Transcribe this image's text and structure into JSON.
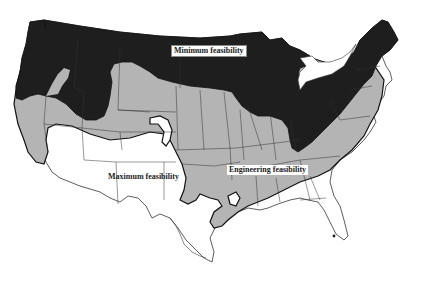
{
  "map": {
    "subject": "Contiguous United States",
    "colors": {
      "minimum_feasibility": "#1e1e1e",
      "engineering_feasibility": "#b4b4b4",
      "maximum_feasibility": "#ffffff",
      "state_border": "#333333",
      "zone_boundary": "#111111"
    },
    "zones": [
      {
        "id": "minimum",
        "label": "Minimum feasibility",
        "fill": "#1e1e1e",
        "region": "Northern tier: Pacific Northwest, northern Rockies & Plains, Great Lakes, Ohio Valley, Appalachians, New England"
      },
      {
        "id": "engineering",
        "label": "Engineering feasibility",
        "fill": "#b4b4b4",
        "region": "Middle band: California, Nevada, Utah, central Plains, Midwest, mid-South, Mid-Atlantic coast"
      },
      {
        "id": "maximum",
        "label": "Maximum feasibility",
        "fill": "#ffffff",
        "region": "Southwest and Gulf/Southeast: Arizona, New Mexico, Texas, Gulf coast, Florida, Georgia, Carolinas"
      }
    ]
  },
  "labels": {
    "minimum": "Minimum feasibility",
    "engineering": "Engineering feasibility",
    "maximum": "Maximum feasibility"
  }
}
